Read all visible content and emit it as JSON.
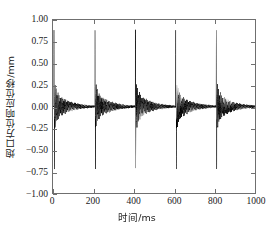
{
  "chart_data": {
    "type": "line",
    "title": "",
    "xlabel": "时间/ms",
    "ylabel": "炮口方位响应位移/mm",
    "xlim": [
      0,
      1000
    ],
    "ylim": [
      -1.0,
      1.0
    ],
    "grid": false,
    "legend": null,
    "line_color": "#000000",
    "xticks": [
      0,
      200,
      400,
      600,
      800,
      1000
    ],
    "xtick_labels": [
      "0",
      "200",
      "400",
      "600",
      "800",
      "1000"
    ],
    "yticks": [
      1.0,
      0.75,
      0.5,
      0.25,
      0.0,
      -0.25,
      -0.5,
      -0.75,
      -1.0
    ],
    "ytick_labels": [
      "1.00",
      "0.75",
      "0.50",
      "0.25",
      "0.00",
      "−0.25",
      "−0.50",
      "−0.75",
      "−1.00"
    ],
    "series_name": "muzzle azimuth response displacement",
    "burst_count": 5,
    "burst_times_ms": [
      5,
      208,
      408,
      608,
      808
    ],
    "burst_peak_positive_mm": [
      0.89,
      0.89,
      0.89,
      0.89,
      0.89
    ],
    "burst_peak_negative_mm": [
      -0.82,
      -0.82,
      -0.82,
      -0.82,
      -0.82
    ],
    "secondary_peak_positive_mm": 0.14,
    "secondary_peak_negative_mm": -0.19,
    "ringing_decay_ms": 70,
    "ringing_frequency_hz": 210,
    "baseline_mm": 0.0
  },
  "axes": {
    "x_title": "时间/ms",
    "y_title": "炮口方位响应位移/mm"
  }
}
